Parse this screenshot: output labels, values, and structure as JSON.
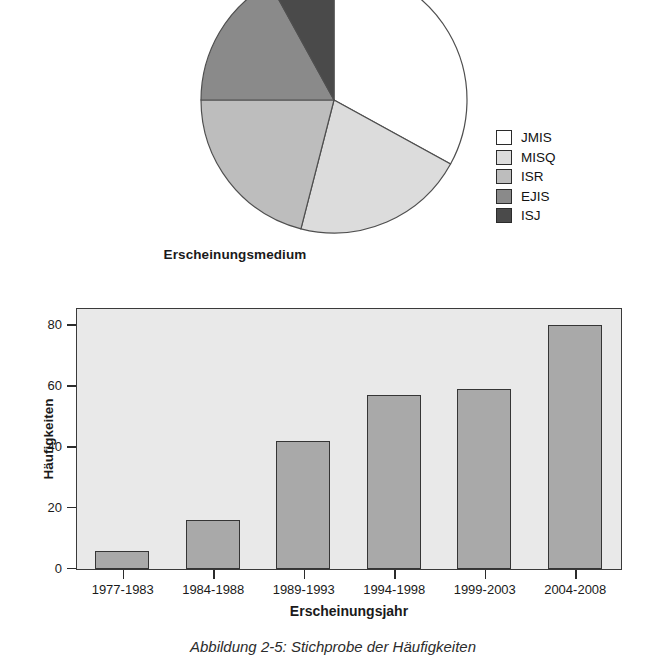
{
  "figure": {
    "caption": "Abbildung 2-5: Stichprobe der Häufigkeiten"
  },
  "chart_data": [
    {
      "type": "pie",
      "title": "Erscheinungsmedium",
      "xlabel": "",
      "ylabel": "",
      "legend_position": "right",
      "categories": [
        "JMIS",
        "MISQ",
        "ISR",
        "EJIS",
        "ISJ"
      ],
      "values": [
        33,
        21,
        21,
        17,
        8
      ],
      "start_angle_deg": 0,
      "direction": "clockwise",
      "slice_colors": [
        "#ffffff",
        "#dcdcdc",
        "#bdbdbd",
        "#8a8a8a",
        "#4a4a4a"
      ],
      "slice_angles_deg": [
        118,
        77,
        77,
        61,
        27
      ],
      "legend": [
        {
          "label": "JMIS",
          "color": "#ffffff"
        },
        {
          "label": "MISQ",
          "color": "#dcdcdc"
        },
        {
          "label": "ISR",
          "color": "#bdbdbd"
        },
        {
          "label": "EJIS",
          "color": "#8a8a8a"
        },
        {
          "label": "ISJ",
          "color": "#4a4a4a"
        }
      ]
    },
    {
      "type": "bar",
      "title": "",
      "xlabel": "Erscheinungsjahr",
      "ylabel": "Häufigkeiten",
      "categories": [
        "1977-1983",
        "1984-1988",
        "1989-1993",
        "1994-1998",
        "1999-2003",
        "2004-2008"
      ],
      "values": [
        6,
        16,
        42,
        57,
        59,
        80
      ],
      "ylim": [
        0,
        85
      ],
      "yticks": [
        0,
        20,
        40,
        60,
        80
      ],
      "ytick_labels": [
        "0",
        "20",
        "40",
        "60",
        "80"
      ],
      "grid": false,
      "bar_color": "#a9a9a9",
      "plot_background": "#e9e9e9"
    }
  ]
}
